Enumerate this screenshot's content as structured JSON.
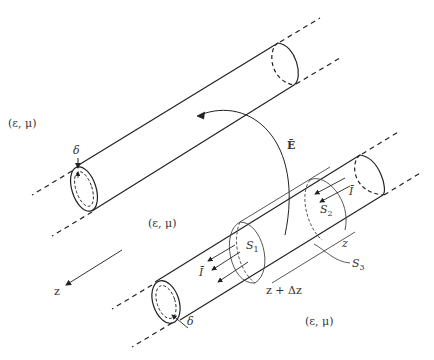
{
  "diagram": {
    "type": "coaxial two-wire transmission line with surface integration boundaries",
    "medium_label": "(ε, μ)",
    "labels": {
      "medium_top_left": "(ε, μ)",
      "medium_center": "(ε, μ)",
      "medium_bottom_right": "(ε, μ)",
      "skin_depth_top": "δ",
      "skin_depth_bottom": "δ",
      "electric_field": "Ē",
      "current_top": "Ī",
      "current_bottom": "Ī",
      "surface_1": "S",
      "surface_1_sub": "1",
      "surface_2": "S",
      "surface_2_sub": "2",
      "surface_3": "S",
      "surface_3_sub": "3",
      "z_position": "z",
      "z_plus_dz": "z + Δz",
      "axis_label": "z"
    },
    "colors": {
      "stroke": "#222222",
      "thin_stroke": "#555555",
      "background": "#ffffff"
    }
  }
}
